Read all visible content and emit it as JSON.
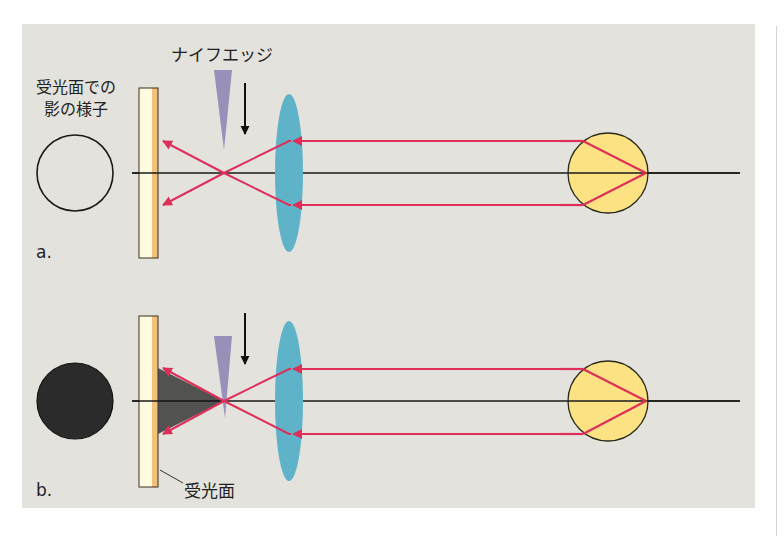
{
  "colors": {
    "panel_bg": "#e4e2dc",
    "ray": "#de2f5a",
    "axis": "#1a1a1a",
    "lens": "#5fb3c8",
    "knife": "#9a8fb8",
    "screen_front": "#fffbe0",
    "screen_back": "#f2c27a",
    "sphere": "#fde283",
    "shadow": "#3a3a3a",
    "shadow_dark": "#2a2a2a"
  },
  "labels": {
    "knife_edge": "ナイフエッジ",
    "shadow_view_line1": "受光面での",
    "shadow_view_line2": "影の様子",
    "screen": "受光面",
    "panel_a": "a.",
    "panel_b": "b."
  },
  "panels": [
    {
      "id": "a",
      "description": "Knife edge above focus; no shadow on screen",
      "shadow_state": "bright"
    },
    {
      "id": "b",
      "description": "Knife edge at focus; screen fully dark",
      "shadow_state": "dark"
    }
  ]
}
